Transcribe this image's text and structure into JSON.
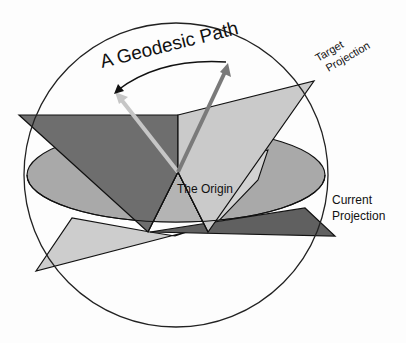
{
  "diagram": {
    "type": "geometric-illustration",
    "labels": {
      "geodesic_path": "A Geodesic Path",
      "target_projection_line1": "Target",
      "target_projection_line2": "Projection",
      "current_projection_line1": "Current",
      "current_projection_line2": "Projection",
      "origin": "The Origin"
    },
    "colors": {
      "background": "#fdfdfd",
      "sphere_outline": "#222222",
      "dark_plane": "#6e6e6e",
      "light_plane": "#c9c9c9",
      "mid_plane": "#a5a5a5",
      "disk": "#a9a9a9",
      "darkest_plane": "#5e5e5e",
      "current_vector": "#c8c8c8",
      "target_vector": "#7a7a7a",
      "geodesic_arc": "#111111"
    },
    "elements": [
      {
        "name": "sphere",
        "shape": "circle",
        "center": [
          176,
          175
        ],
        "radius": 152
      },
      {
        "name": "current-projection-disk",
        "shape": "ellipse"
      },
      {
        "name": "target-projection-plane",
        "shape": "polygon"
      },
      {
        "name": "current-vector",
        "from": "origin",
        "direction": "upper-left"
      },
      {
        "name": "target-vector",
        "from": "origin",
        "direction": "upper-right"
      },
      {
        "name": "geodesic-arc",
        "from": "target-vector-tip",
        "to": "current-vector-tip"
      }
    ]
  }
}
